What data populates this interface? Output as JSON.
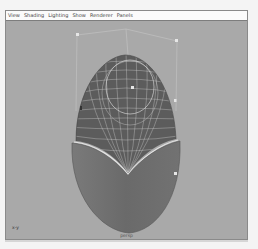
{
  "menu_bar": {
    "items": [
      {
        "label": "View"
      },
      {
        "label": "Shading"
      },
      {
        "label": "Lighting"
      },
      {
        "label": "Show"
      },
      {
        "label": "Renderer"
      },
      {
        "label": "Panels"
      }
    ]
  },
  "viewport": {
    "camera_label": "persp",
    "axis_label": "x-y",
    "colors": {
      "background": "#a9a9a9",
      "shaded_surface": "#6e6e6e",
      "wire_surface": "#5a5a5a",
      "wireframe": "#d8d8d8",
      "control_point": "#e6e6e6",
      "hull_line": "#c4c4c4"
    }
  }
}
